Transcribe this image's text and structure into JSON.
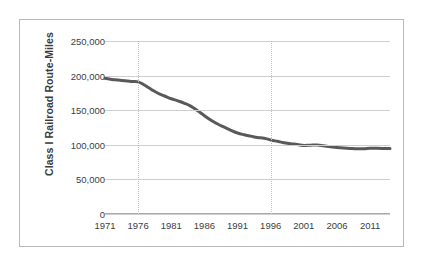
{
  "chart_data": {
    "type": "line",
    "title": "",
    "xlabel": "",
    "ylabel": "Class I Railroad Route-Miles",
    "xlim": [
      1971,
      2014
    ],
    "ylim": [
      0,
      250000
    ],
    "grid": true,
    "legend": false,
    "y_ticks": [
      0,
      50000,
      100000,
      150000,
      200000,
      250000
    ],
    "y_tick_labels": [
      "0",
      "50,000",
      "100,000",
      "150,000",
      "200,000",
      "250,000"
    ],
    "x_ticks": [
      1971,
      1976,
      1981,
      1986,
      1991,
      1996,
      2001,
      2006,
      2011
    ],
    "x_tick_labels": [
      "1971",
      "1976",
      "1981",
      "1986",
      "1991",
      "1996",
      "2001",
      "2006",
      "2011"
    ],
    "vertical_gridlines_at": [
      1976,
      1996
    ],
    "series": [
      {
        "name": "Class I Railroad Route-Miles",
        "color": "#595959",
        "x": [
          1971,
          1972,
          1973,
          1974,
          1975,
          1976,
          1977,
          1978,
          1979,
          1980,
          1981,
          1982,
          1983,
          1984,
          1985,
          1986,
          1987,
          1988,
          1989,
          1990,
          1991,
          1992,
          1993,
          1994,
          1995,
          1996,
          1997,
          1998,
          1999,
          2000,
          2001,
          2002,
          2003,
          2004,
          2005,
          2006,
          2007,
          2008,
          2009,
          2010,
          2011,
          2012,
          2013,
          2014
        ],
        "values": [
          196000,
          194500,
          193500,
          192500,
          191500,
          191000,
          186000,
          180000,
          174500,
          170500,
          166500,
          163500,
          160000,
          155500,
          149000,
          142000,
          135500,
          130000,
          125500,
          121000,
          117000,
          114500,
          112500,
          110500,
          109500,
          107000,
          105000,
          103000,
          101500,
          100500,
          99000,
          99500,
          99800,
          98500,
          97000,
          96200,
          95500,
          94800,
          94200,
          94200,
          95000,
          95000,
          94800,
          94500
        ]
      }
    ]
  }
}
